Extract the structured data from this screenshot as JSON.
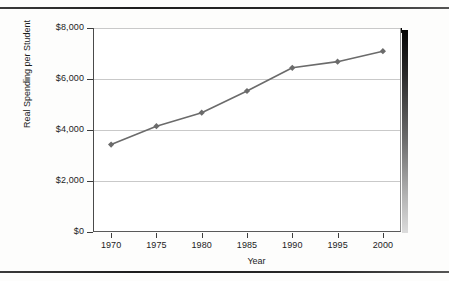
{
  "figure": {
    "y_axis_title": "Real Spending per Student",
    "x_axis_title": "Year"
  },
  "chart_data": {
    "type": "line",
    "title": "",
    "subtitle": "",
    "xlabel": "Year",
    "ylabel": "Real Spending per Student",
    "x": [
      1970,
      1975,
      1980,
      1985,
      1990,
      1995,
      2000
    ],
    "categories": [
      "1970",
      "1975",
      "1980",
      "1985",
      "1990",
      "1995",
      "2000"
    ],
    "values": [
      3430,
      4150,
      4680,
      5530,
      6440,
      6680,
      7090
    ],
    "series": [
      {
        "name": "Real Spending per Student",
        "values": [
          3430,
          4150,
          4680,
          5530,
          6440,
          6680,
          7090
        ],
        "color": "#6b6b6b",
        "marker": "diamond"
      }
    ],
    "xlim": [
      1968,
      2002
    ],
    "ylim": [
      0,
      8000
    ],
    "ytick_values": [
      0,
      2000,
      4000,
      6000,
      8000
    ],
    "ytick_labels": [
      "$0",
      "$2,000",
      "$4,000",
      "$6,000",
      "$8,000"
    ],
    "xtick_labels": [
      "1970",
      "1975",
      "1980",
      "1985",
      "1990",
      "1995",
      "2000"
    ],
    "grid": "horizontal",
    "legend": "none",
    "currency": "USD"
  },
  "colors": {
    "series_line": "#6b6b6b",
    "gridline": "#c9c9c9",
    "axis": "#3d3d3d",
    "text": "#1c1c1c",
    "shadow": "#000000"
  }
}
